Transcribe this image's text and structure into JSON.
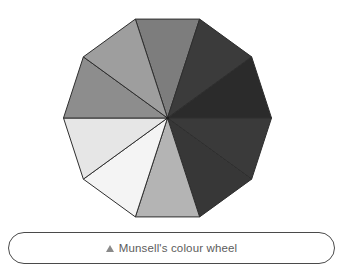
{
  "figure": {
    "name": "munsell-colour-wheel",
    "background_color": "#ffffff",
    "wheel": {
      "shape": "decagon",
      "segment_count": 10,
      "center_x": 167.5,
      "center_y": 118,
      "radius": 104,
      "start_angle_deg": -108,
      "stroke_color": "#2e2e2e",
      "stroke_width": 1,
      "segments": [
        {
          "index": 1,
          "position": "top-left-of-apex",
          "value_step": "high-mid",
          "color": "#7d7d7d"
        },
        {
          "index": 2,
          "position": "top-right-of-apex",
          "value_step": "low",
          "color": "#3b3b3b"
        },
        {
          "index": 3,
          "position": "upper-right",
          "value_step": "lowest",
          "color": "#2b2b2b"
        },
        {
          "index": 4,
          "position": "right-upper",
          "value_step": "very-low",
          "color": "#3a3a3a"
        },
        {
          "index": 5,
          "position": "right-lower",
          "value_step": "low-mid",
          "color": "#373737"
        },
        {
          "index": 6,
          "position": "lower-right",
          "value_step": "mid-high",
          "color": "#b4b4b4"
        },
        {
          "index": 7,
          "position": "bottom-right",
          "value_step": "highest",
          "color": "#f4f4f4"
        },
        {
          "index": 8,
          "position": "bottom-left",
          "value_step": "very-high",
          "color": "#e6e6e6"
        },
        {
          "index": 9,
          "position": "lower-left",
          "value_step": "mid",
          "color": "#8d8d8d"
        },
        {
          "index": 10,
          "position": "left",
          "value_step": "mid-light",
          "color": "#9e9e9e"
        }
      ]
    }
  },
  "caption": {
    "marker_icon": "triangle-up-icon",
    "text": "Munsell's colour wheel"
  }
}
